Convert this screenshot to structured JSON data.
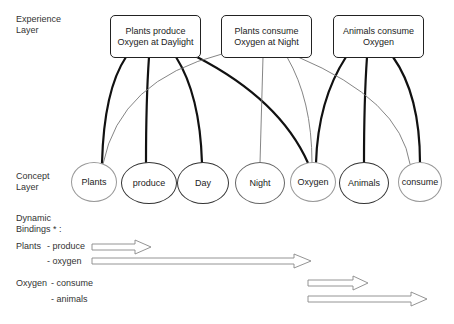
{
  "layers": {
    "experience": "Experience\nLayer",
    "concept": "Concept\nLayer",
    "dynamic": "Dynamic\nBindings * :"
  },
  "experience_nodes": [
    {
      "id": "e1",
      "label": "Plants produce\nOxygen at Daylight"
    },
    {
      "id": "e2",
      "label": "Plants consume\nOxygen at Night"
    },
    {
      "id": "e3",
      "label": "Animals consume\nOxygen"
    }
  ],
  "concept_nodes": [
    {
      "id": "plants",
      "label": "Plants"
    },
    {
      "id": "produce",
      "label": "produce"
    },
    {
      "id": "day",
      "label": "Day"
    },
    {
      "id": "night",
      "label": "Night"
    },
    {
      "id": "oxygen",
      "label": "Oxygen"
    },
    {
      "id": "animals",
      "label": "Animals"
    },
    {
      "id": "consume",
      "label": "consume"
    }
  ],
  "connections": [
    {
      "from": "e1",
      "to": "plants",
      "weight": "strong"
    },
    {
      "from": "e1",
      "to": "produce",
      "weight": "strong"
    },
    {
      "from": "e1",
      "to": "day",
      "weight": "strong"
    },
    {
      "from": "e1",
      "to": "oxygen",
      "weight": "strong"
    },
    {
      "from": "e2",
      "to": "plants",
      "weight": "weak"
    },
    {
      "from": "e2",
      "to": "night",
      "weight": "weak"
    },
    {
      "from": "e2",
      "to": "oxygen",
      "weight": "weak"
    },
    {
      "from": "e2",
      "to": "consume",
      "weight": "weak"
    },
    {
      "from": "e3",
      "to": "oxygen",
      "weight": "strong"
    },
    {
      "from": "e3",
      "to": "animals",
      "weight": "strong"
    },
    {
      "from": "e3",
      "to": "consume",
      "weight": "strong"
    }
  ],
  "bindings": {
    "plants_label": "Plants",
    "plants_produce": "- produce",
    "plants_oxygen": "- oxygen",
    "oxygen_label": "Oxygen",
    "oxygen_consume": "- consume",
    "oxygen_animals": "- animals"
  }
}
